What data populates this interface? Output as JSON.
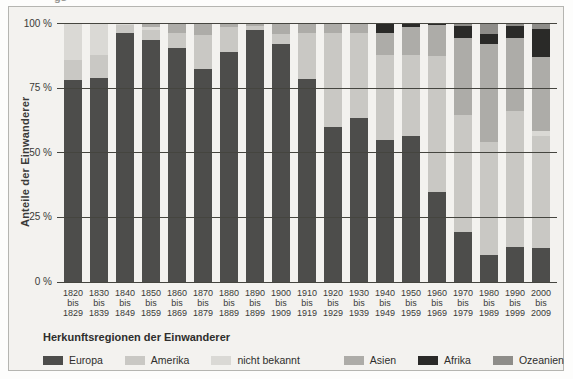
{
  "artifact": {
    "cropped_text": "gs"
  },
  "chart_data": {
    "type": "bar",
    "stacked": true,
    "title": "",
    "ylabel": "Anteile der Einwanderer",
    "xlabel": "",
    "ylim": [
      0,
      100
    ],
    "grid": true,
    "yticks": {
      "labels": [
        "100 %",
        "75 %",
        "50 %",
        "25 %",
        "0 %"
      ],
      "values": [
        100,
        75,
        50,
        25,
        0
      ]
    },
    "x_separator": "bis",
    "categories": [
      {
        "from": "1820",
        "to": "1829"
      },
      {
        "from": "1830",
        "to": "1839"
      },
      {
        "from": "1840",
        "to": "1849"
      },
      {
        "from": "1850",
        "to": "1859"
      },
      {
        "from": "1860",
        "to": "1869"
      },
      {
        "from": "1870",
        "to": "1879"
      },
      {
        "from": "1880",
        "to": "1889"
      },
      {
        "from": "1890",
        "to": "1899"
      },
      {
        "from": "1900",
        "to": "1909"
      },
      {
        "from": "1910",
        "to": "1919"
      },
      {
        "from": "1920",
        "to": "1929"
      },
      {
        "from": "1930",
        "to": "1939"
      },
      {
        "from": "1940",
        "to": "1949"
      },
      {
        "from": "1950",
        "to": "1959"
      },
      {
        "from": "1960",
        "to": "1969"
      },
      {
        "from": "1970",
        "to": "1979"
      },
      {
        "from": "1980",
        "to": "1989"
      },
      {
        "from": "1990",
        "to": "1999"
      },
      {
        "from": "2000",
        "to": "2009"
      }
    ],
    "series": [
      {
        "name": "Europa",
        "color": "#4d4d4b",
        "values": [
          78,
          79,
          96.5,
          93.5,
          90.5,
          82.5,
          89,
          97.5,
          92,
          78.5,
          60,
          63.5,
          55,
          56.5,
          35,
          19.5,
          10.5,
          13.5,
          13
        ]
      },
      {
        "name": "Amerika",
        "color": "#c9c8c4",
        "values": [
          8,
          9,
          3,
          4,
          6,
          13,
          9.5,
          1.5,
          4,
          18,
          36.5,
          33,
          33,
          31.5,
          52.5,
          45,
          43.5,
          52.5,
          43.5
        ]
      },
      {
        "name": "nicht bekannt",
        "color": "#dad9d5",
        "values": [
          14,
          12,
          0.5,
          1,
          0,
          0,
          0,
          0,
          0,
          0,
          0,
          0,
          0,
          0,
          0,
          0,
          0,
          0,
          2
        ]
      },
      {
        "name": "Asien",
        "color": "#adaca8",
        "values": [
          0,
          0,
          0,
          1.5,
          3.5,
          4.5,
          1.5,
          1,
          4,
          3.5,
          3.5,
          3.5,
          8.5,
          10.5,
          12,
          30,
          38,
          28.5,
          28.5
        ]
      },
      {
        "name": "Afrika",
        "color": "#2a2a28",
        "values": [
          0,
          0,
          0,
          0,
          0,
          0,
          0,
          0,
          0,
          0,
          0,
          0,
          3.5,
          1.5,
          0.5,
          4.5,
          4,
          4.5,
          11
        ]
      },
      {
        "name": "Ozeanien",
        "color": "#8e8d89",
        "values": [
          0,
          0,
          0,
          0,
          0,
          0,
          0,
          0,
          0,
          0,
          0,
          0,
          0,
          0,
          0,
          1,
          4,
          1,
          2
        ]
      }
    ],
    "legend": {
      "title": "Herkunftsregionen der Einwanderer",
      "position": "bottom"
    }
  }
}
